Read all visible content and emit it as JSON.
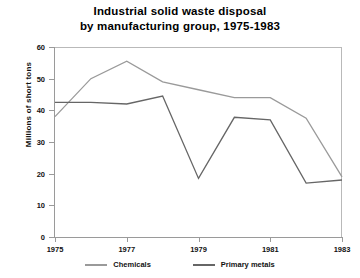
{
  "chart_data": {
    "type": "line",
    "title": "Industrial solid waste disposal\nby manufacturing group, 1975-1983",
    "title_line1": "Industrial solid waste disposal",
    "title_line2": "by manufacturing group, 1975-1983",
    "xlabel": "",
    "ylabel": "Millions of short tons",
    "x": [
      1975,
      1976,
      1977,
      1978,
      1979,
      1980,
      1981,
      1982,
      1983
    ],
    "xlim": [
      1975,
      1983
    ],
    "ylim": [
      0,
      60
    ],
    "xticks": [
      "1975",
      "1977",
      "1979",
      "1981",
      "1983"
    ],
    "xtick_values": [
      1975,
      1977,
      1979,
      1981,
      1983
    ],
    "yticks": [
      "0",
      "10",
      "20",
      "30",
      "40",
      "50",
      "60"
    ],
    "ytick_values": [
      0,
      10,
      20,
      30,
      40,
      50,
      60
    ],
    "grid": false,
    "legend_position": "bottom",
    "series": [
      {
        "name": "Chemicals",
        "color": "#9a9a9a",
        "values": [
          38,
          50,
          55.5,
          49,
          46.5,
          44,
          44,
          37.5,
          19
        ]
      },
      {
        "name": "Primary metals",
        "color": "#666666",
        "values": [
          42.5,
          42.5,
          42,
          44.5,
          18.5,
          37.8,
          37,
          17,
          18
        ]
      }
    ]
  },
  "legend": {
    "items": [
      {
        "label": "Chemicals",
        "color": "#9a9a9a"
      },
      {
        "label": "Primary metals",
        "color": "#666666"
      }
    ]
  },
  "colors": {
    "axis": "#9a9a9a",
    "frame": "#b9b9b9",
    "text": "#111111",
    "background": "#ffffff"
  }
}
